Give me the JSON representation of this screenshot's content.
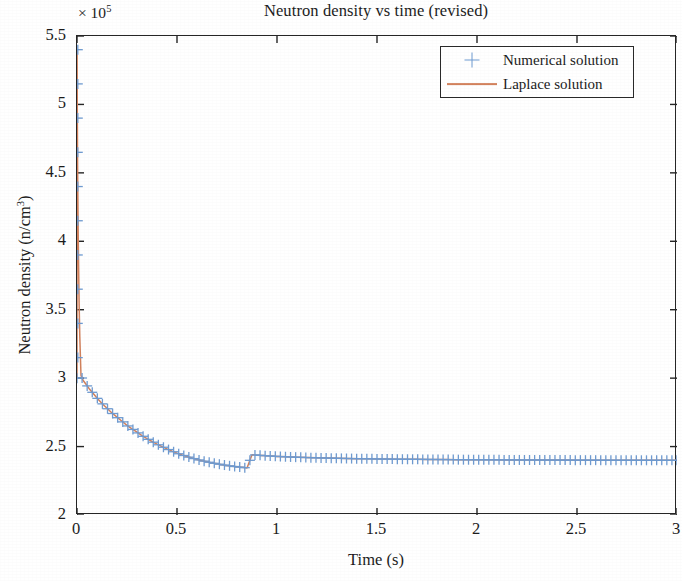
{
  "chart_data": {
    "type": "line",
    "title": "Neutron density vs time (revised)",
    "xlabel": "Time (s)",
    "ylabel_text": "Neutron density (n/cm",
    "ylabel_sup": "3",
    "ylabel_tail": ")",
    "ylabel_full": "Neutron density (n/cm3)",
    "y_multiplier_prefix": "× 10",
    "y_multiplier_exponent": "5",
    "y_multiplier_full": "× 10^5",
    "xlim": [
      0,
      3
    ],
    "ylim": [
      2,
      5.5
    ],
    "xticks": [
      0,
      0.5,
      1,
      1.5,
      2,
      2.5,
      3
    ],
    "xtick_labels": [
      "0",
      "0.5",
      "1",
      "1.5",
      "2",
      "2.5",
      "3"
    ],
    "yticks": [
      2,
      2.5,
      3,
      3.5,
      4,
      4.5,
      5,
      5.5
    ],
    "ytick_labels": [
      "2",
      "2.5",
      "3",
      "3.5",
      "4",
      "4.5",
      "5",
      "5.5"
    ],
    "grid": false,
    "legend_position": "top-right",
    "y_scale_factor": 100000,
    "series": [
      {
        "name": "Numerical solution",
        "marker": "+",
        "color": "#6f9bd1",
        "style": "markers",
        "x": [
          0,
          0.0005,
          0.0012,
          0.002,
          0.003,
          0.0045,
          0.006,
          0.008,
          0.0105,
          0.014,
          0.02,
          0.03,
          0.045,
          0.06,
          0.08,
          0.1,
          0.125,
          0.15,
          0.175,
          0.2,
          0.225,
          0.25,
          0.275,
          0.3,
          0.325,
          0.35,
          0.375,
          0.4,
          0.425,
          0.45,
          0.475,
          0.5,
          0.525,
          0.55,
          0.575,
          0.6,
          0.625,
          0.65,
          0.675,
          0.7,
          0.725,
          0.75,
          0.775,
          0.8,
          0.825,
          0.85,
          0.875,
          0.9,
          0.925,
          0.95,
          0.975,
          1.0,
          1.05,
          1.1,
          1.15,
          1.2,
          1.25,
          1.3,
          1.35,
          1.4,
          1.45,
          1.5,
          1.55,
          1.6,
          1.65,
          1.7,
          1.75,
          1.8,
          1.85,
          1.9,
          1.95,
          2.0,
          2.05,
          2.1,
          2.15,
          2.2,
          2.25,
          2.3,
          2.35,
          2.4,
          2.45,
          2.5,
          2.55,
          2.6,
          2.65,
          2.7,
          2.75,
          2.8,
          2.85,
          2.9,
          2.95,
          3.0
        ],
        "y": [
          3.0,
          5.4,
          5.05,
          4.82,
          4.55,
          4.3,
          4.05,
          3.82,
          3.55,
          3.3,
          3.02,
          2.985,
          2.955,
          2.925,
          2.89,
          2.855,
          2.815,
          2.78,
          2.745,
          2.715,
          2.685,
          2.655,
          2.63,
          2.605,
          2.58,
          2.558,
          2.537,
          2.518,
          2.5,
          2.483,
          2.467,
          2.452,
          2.439,
          2.427,
          2.416,
          2.406,
          2.397,
          2.389,
          2.381,
          2.374,
          2.368,
          2.362,
          2.357,
          2.352,
          2.348,
          2.344,
          2.4405,
          2.4375,
          2.4348,
          2.4324,
          2.4302,
          2.4283,
          2.425,
          2.4222,
          2.4198,
          2.4177,
          2.4159,
          2.4143,
          2.4129,
          2.4117,
          2.4106,
          2.4096,
          2.4087,
          2.4079,
          2.4072,
          2.4066,
          2.406,
          2.4054,
          2.4049,
          2.4045,
          2.404,
          2.4036,
          2.4033,
          2.4029,
          2.4026,
          2.4023,
          2.402,
          2.4018,
          2.4015,
          2.4013,
          2.4011,
          2.4009,
          2.4007,
          2.4005,
          2.4003,
          2.4002,
          2.4,
          2.3999,
          2.3997,
          2.3996,
          2.3995,
          2.3994
        ]
      },
      {
        "name": "Laplace solution",
        "marker": "none",
        "color": "#d2815c",
        "style": "line",
        "note": "overlaps numerical solution; identical decay profile"
      }
    ],
    "description_points": {
      "initial_value": 3.0,
      "spike_peak": 5.4,
      "spike_time": 0.0,
      "steady_state": 2.34,
      "steady_state_reached_after": 1.5
    }
  },
  "legend": {
    "items": [
      {
        "label": "Numerical solution",
        "marker": "plus-marker",
        "color": "#6f9bd1"
      },
      {
        "label": "Laplace solution",
        "marker": "line-sample",
        "color": "#d2815c"
      }
    ]
  },
  "colors": {
    "numerical": "#6f9bd1",
    "laplace": "#d2815c",
    "axis": "#262626",
    "text": "#1c1c1c",
    "background": "#ffffff"
  }
}
